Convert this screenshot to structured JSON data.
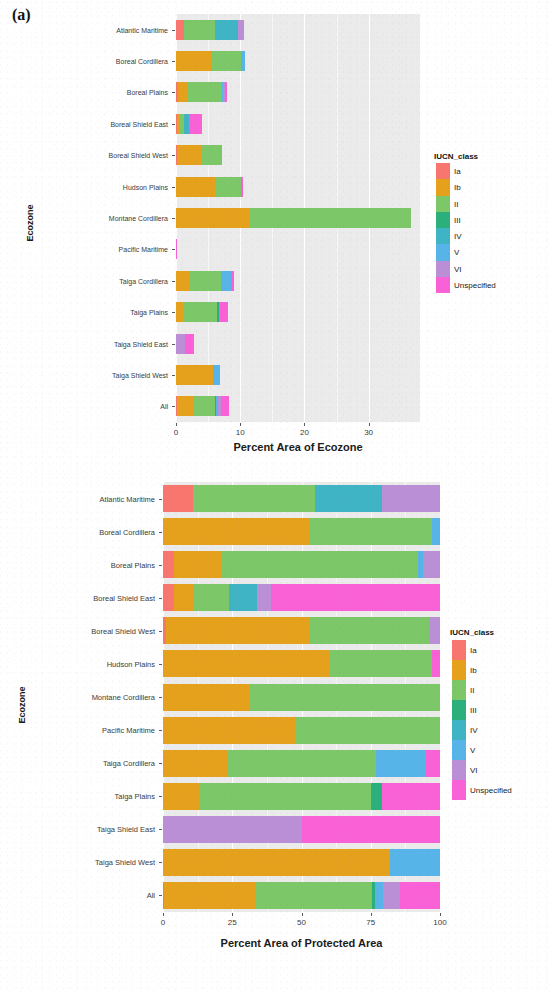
{
  "figure": {
    "panel_a_label": "(a)",
    "panel_b_label": ""
  },
  "legend": {
    "title": "IUCN_class",
    "keys": [
      "Ia",
      "Ib",
      "II",
      "III",
      "IV",
      "V",
      "VI",
      "Unspecified"
    ],
    "colors": {
      "Ia": "#F8766D",
      "Ib": "#E5A11B",
      "II": "#7CC767",
      "III": "#2BB07B",
      "IV": "#3FB4C4",
      "V": "#56B4E9",
      "VI": "#BA8FD6",
      "Unspecified": "#FB61D7"
    }
  },
  "chart_data": [
    {
      "id": "panel_a",
      "type": "bar",
      "orientation": "horizontal",
      "stacked": true,
      "title": "(a)",
      "xlabel": "Percent Area of Ecozone",
      "ylabel": "Ecozone",
      "xlim": [
        0,
        38
      ],
      "xticks": [
        0,
        10,
        20,
        30
      ],
      "xtick_labels": [
        "0",
        "10",
        "20",
        "30"
      ],
      "grid": true,
      "legend_position": "right",
      "legend_title": "IUCN_class",
      "categories": [
        "Atlantic Maritime",
        "Boreal Cordillera",
        "Boreal Plains",
        "Boreal Shield East",
        "Boreal Shield West",
        "Hudson Plains",
        "Montane Cordillera",
        "Pacific Maritime",
        "Taiga Cordillera",
        "Taiga Plains",
        "Taiga Shield East",
        "Taiga Shield West",
        "All"
      ],
      "series": [
        {
          "name": "Ia",
          "values": [
            1.2,
            0.0,
            0.3,
            0.1,
            0.1,
            0.0,
            0.0,
            0.0,
            0.0,
            0.0,
            0.0,
            0.0,
            0.1
          ]
        },
        {
          "name": "Ib",
          "values": [
            0.0,
            5.6,
            1.4,
            0.3,
            3.8,
            6.3,
            11.6,
            0.0,
            2.1,
            1.1,
            0.0,
            5.7,
            2.6
          ]
        },
        {
          "name": "II",
          "values": [
            4.9,
            4.6,
            5.5,
            0.9,
            3.1,
            3.9,
            25.0,
            0.0,
            4.9,
            5.3,
            0.0,
            0.0,
            3.4
          ]
        },
        {
          "name": "III",
          "values": [
            0.0,
            0.0,
            0.0,
            0.0,
            0.0,
            0.0,
            0.0,
            0.0,
            0.0,
            0.3,
            0.0,
            0.0,
            0.1
          ]
        },
        {
          "name": "IV",
          "values": [
            3.5,
            0.0,
            0.0,
            0.7,
            0.0,
            0.0,
            0.0,
            0.0,
            0.0,
            0.0,
            0.0,
            0.0,
            0.0
          ]
        },
        {
          "name": "V",
          "values": [
            0.0,
            0.6,
            0.1,
            0.0,
            0.0,
            0.0,
            0.0,
            0.0,
            1.6,
            0.0,
            0.0,
            1.2,
            0.3
          ]
        },
        {
          "name": "VI",
          "values": [
            1.0,
            0.0,
            0.4,
            0.0,
            0.2,
            0.0,
            0.0,
            0.0,
            0.0,
            0.0,
            1.4,
            0.0,
            0.5
          ]
        },
        {
          "name": "Unspecified",
          "values": [
            0.0,
            0.0,
            0.2,
            2.1,
            0.0,
            0.3,
            0.0,
            0.1,
            0.4,
            1.4,
            1.4,
            0.0,
            1.2
          ]
        }
      ]
    },
    {
      "id": "panel_b",
      "type": "bar",
      "orientation": "horizontal",
      "stacked": true,
      "title": "",
      "xlabel": "Percent Area of Protected Area",
      "ylabel": "Ecozone",
      "xlim": [
        0,
        100
      ],
      "xticks": [
        0,
        25,
        50,
        75,
        100
      ],
      "xtick_labels": [
        "0",
        "25",
        "50",
        "75",
        "100"
      ],
      "grid": true,
      "legend_position": "right",
      "legend_title": "IUCN_class",
      "categories": [
        "Atlantic Maritime",
        "Boreal Cordillera",
        "Boreal Plains",
        "Boreal Shield East",
        "Boreal Shield West",
        "Hudson Plains",
        "Montane Cordillera",
        "Pacific Maritime",
        "Taiga Cordillera",
        "Taiga Plains",
        "Taiga Shield East",
        "Taiga Shield West",
        "All"
      ],
      "series": [
        {
          "name": "Ia",
          "values": [
            11.0,
            0.0,
            4.0,
            4.0,
            1.0,
            0.0,
            0.0,
            0.0,
            0.0,
            0.0,
            0.0,
            0.0,
            0.5
          ]
        },
        {
          "name": "Ib",
          "values": [
            0.0,
            53.0,
            17.0,
            7.0,
            52.0,
            60.0,
            31.0,
            48.0,
            23.0,
            13.0,
            0.0,
            82.0,
            33.0
          ]
        },
        {
          "name": "II",
          "values": [
            44.0,
            44.0,
            71.0,
            13.0,
            43.0,
            37.0,
            69.0,
            52.0,
            54.0,
            62.0,
            0.0,
            0.0,
            42.0
          ]
        },
        {
          "name": "III",
          "values": [
            0.0,
            0.0,
            0.0,
            0.0,
            0.0,
            0.0,
            0.0,
            0.0,
            0.0,
            4.0,
            0.0,
            0.0,
            1.0
          ]
        },
        {
          "name": "IV",
          "values": [
            24.0,
            0.0,
            0.0,
            10.0,
            0.0,
            0.0,
            0.0,
            0.0,
            0.0,
            0.0,
            0.0,
            0.0,
            0.0
          ]
        },
        {
          "name": "V",
          "values": [
            0.0,
            3.0,
            2.0,
            0.0,
            0.0,
            0.0,
            0.0,
            0.0,
            18.0,
            0.0,
            0.0,
            18.0,
            3.0
          ]
        },
        {
          "name": "VI",
          "values": [
            21.0,
            0.0,
            6.0,
            5.0,
            4.0,
            0.0,
            0.0,
            0.0,
            0.0,
            0.0,
            50.0,
            0.0,
            6.0
          ]
        },
        {
          "name": "Unspecified",
          "values": [
            0.0,
            0.0,
            0.0,
            61.0,
            0.0,
            3.0,
            0.0,
            0.0,
            5.0,
            21.0,
            50.0,
            0.0,
            14.5
          ]
        }
      ]
    }
  ]
}
